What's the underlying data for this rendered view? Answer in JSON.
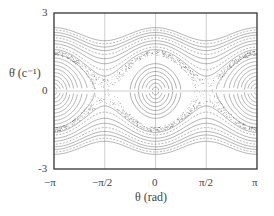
{
  "chart_data": {
    "type": "line",
    "title": "",
    "subtitle": "",
    "xlabel": "θ (rad)",
    "ylabel": "θ̇ (c⁻¹)",
    "xlim": [
      -3.14159,
      3.14159
    ],
    "ylim": [
      -3,
      3
    ],
    "x_ticks": [
      {
        "value": -3.14159,
        "label": "−π"
      },
      {
        "value": -1.5708,
        "label": "−π/2"
      },
      {
        "value": 0,
        "label": "0"
      },
      {
        "value": 1.5708,
        "label": "π/2"
      },
      {
        "value": 3.14159,
        "label": "π"
      }
    ],
    "y_ticks": [
      {
        "value": 3,
        "label": "3"
      },
      {
        "value": 0,
        "label": "0"
      },
      {
        "value": -3,
        "label": "-3"
      }
    ],
    "grid": {
      "x": [
        -1.5708,
        0,
        1.5708
      ],
      "y": [
        0
      ]
    },
    "legend": null,
    "libration_orbits_center": {
      "center": [
        0,
        0
      ],
      "amplitudes": [
        0.15,
        0.3,
        0.45,
        0.6,
        0.75,
        0.9,
        1.05
      ]
    },
    "libration_orbits_edges": {
      "centers": [
        [
          -3.14159,
          0
        ],
        [
          3.14159,
          0
        ]
      ],
      "amplitudes": [
        0.2,
        0.4,
        0.6,
        0.8,
        1.0,
        1.2,
        1.4,
        1.6,
        1.8,
        2.0
      ]
    },
    "rotation_orbits": {
      "energy_levels": [
        1.35,
        1.5,
        1.7,
        1.9,
        2.1,
        2.3,
        2.5,
        2.7,
        2.9
      ]
    },
    "chaotic_layer": {
      "hyperbolic_points": [
        [
          -1.5708,
          0
        ],
        [
          1.5708,
          0
        ]
      ],
      "width": 0.25
    },
    "colors": {
      "curve": "#555555",
      "frame": "#333333",
      "grid": "#999999",
      "chaos": "#222222"
    }
  },
  "axes": {
    "xlabel": "θ (rad)",
    "ylabel_theta": "θ̇",
    "ylabel_unit": "(c⁻¹)",
    "x_tick_labels": [
      "−π",
      "−π/2",
      "0",
      "π/2",
      "π"
    ],
    "y_tick_labels": [
      "3",
      "0",
      "-3"
    ]
  }
}
